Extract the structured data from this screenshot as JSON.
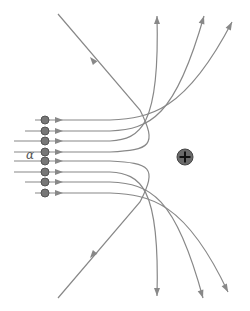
{
  "diagram": {
    "particle_label": "α",
    "nucleus_symbol": "+",
    "colors": {
      "line": "#888888",
      "particle_fill": "#777777",
      "particle_stroke": "#555555",
      "nucleus_fill": "#6a6a6a",
      "nucleus_sign": "#111111",
      "background": "#ffffff"
    },
    "nucleus": {
      "x": 185,
      "y": 157,
      "r": 8
    },
    "particles": [
      {
        "x": 45,
        "y": 120
      },
      {
        "x": 45,
        "y": 131
      },
      {
        "x": 45,
        "y": 141
      },
      {
        "x": 45,
        "y": 152
      },
      {
        "x": 45,
        "y": 161
      },
      {
        "x": 45,
        "y": 172
      },
      {
        "x": 45,
        "y": 182
      },
      {
        "x": 45,
        "y": 193
      }
    ],
    "trajectories": [
      {
        "name": "top-1",
        "d": "M35 120 L110 120 C150 118 185 112 232 22"
      },
      {
        "name": "top-2",
        "d": "M25 131 L110 131 C150 129 175 118 204 16"
      },
      {
        "name": "top-3",
        "d": "M14 141 L110 141 C140 139 160 128 157 16"
      },
      {
        "name": "top-4",
        "d": "M14 152 L110 152 C150 150 158 146 140 110 L58 14"
      },
      {
        "name": "bot-4",
        "d": "M14 161 L110 161 C150 163 158 167 140 202 L58 298"
      },
      {
        "name": "bot-3",
        "d": "M14 172 L110 172 C140 174 160 185 157 296"
      },
      {
        "name": "bot-2",
        "d": "M25 182 L110 182 C150 184 175 195 203 298"
      },
      {
        "name": "bot-1",
        "d": "M35 193 L110 193 C150 195 185 201 228 292"
      }
    ],
    "end_arrows": [
      {
        "x": 232,
        "y": 22,
        "angle": -62
      },
      {
        "x": 204,
        "y": 16,
        "angle": -72
      },
      {
        "x": 157,
        "y": 16,
        "angle": -90
      },
      {
        "x": 157,
        "y": 296,
        "angle": 90
      },
      {
        "x": 203,
        "y": 298,
        "angle": 72
      },
      {
        "x": 228,
        "y": 292,
        "angle": 62
      }
    ],
    "mid_arrows": [
      {
        "x": 90,
        "y": 57,
        "angle": -130
      },
      {
        "x": 90,
        "y": 258,
        "angle": 130
      }
    ]
  }
}
